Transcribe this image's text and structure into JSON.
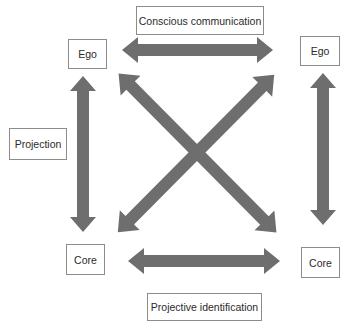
{
  "diagram": {
    "nodes": {
      "ego_left": "Ego",
      "ego_right": "Ego",
      "core_left": "Core",
      "core_right": "Core"
    },
    "labels": {
      "top": "Conscious communication",
      "left": "Projection",
      "bottom": "Projective identification"
    },
    "edges": [
      {
        "from": "Ego (left)",
        "to": "Ego (right)",
        "type": "bidirectional",
        "label": "Conscious communication"
      },
      {
        "from": "Core (left)",
        "to": "Core (right)",
        "type": "bidirectional",
        "label": "Projective identification"
      },
      {
        "from": "Ego (left)",
        "to": "Core (left)",
        "type": "bidirectional",
        "label": "Projection"
      },
      {
        "from": "Ego (right)",
        "to": "Core (right)",
        "type": "bidirectional"
      },
      {
        "from": "Ego (left)",
        "to": "Core (right)",
        "type": "bidirectional"
      },
      {
        "from": "Ego (right)",
        "to": "Core (left)",
        "type": "bidirectional"
      }
    ],
    "colors": {
      "arrow_fill": "#6e6e6e",
      "box_border": "#8c8c8c",
      "text": "#2b2b2b",
      "background": "#ffffff"
    }
  }
}
